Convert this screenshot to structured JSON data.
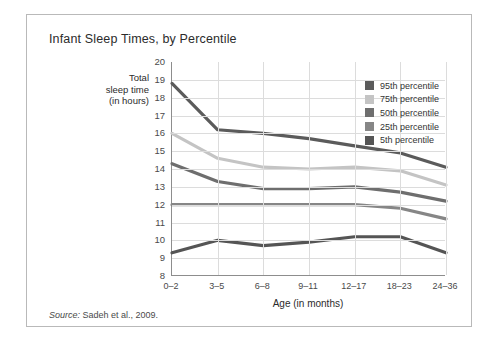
{
  "figure": {
    "title": "Infant Sleep Times, by Percentile",
    "source_prefix": "Source:",
    "source_text": " Sadeh et al., 2009."
  },
  "axes": {
    "y_title_line1": "Total",
    "y_title_line2": "sleep time",
    "y_title_line3": "(in hours)",
    "x_title": "Age (in months)",
    "y_ticks": [
      "20",
      "19",
      "18",
      "17",
      "16",
      "15",
      "14",
      "13",
      "12",
      "11",
      "10",
      "9",
      "8"
    ]
  },
  "legend": {
    "items": [
      {
        "label": "95th percentile",
        "color": "#5b5b5b"
      },
      {
        "label": "75th percentile",
        "color": "#c4c4c4"
      },
      {
        "label": "50th percentile",
        "color": "#6e6e6e"
      },
      {
        "label": "25th percentile",
        "color": "#868686"
      },
      {
        "label": "5th percentile",
        "color": "#555555"
      }
    ]
  },
  "chart_data": {
    "type": "line",
    "title": "Infant Sleep Times, by Percentile",
    "xlabel": "Age (in months)",
    "ylabel": "Total sleep time (in hours)",
    "categories": [
      "0-2",
      "3-5",
      "6-8",
      "9-11",
      "12-17",
      "18-23",
      "24-36"
    ],
    "ylim": [
      8,
      20
    ],
    "ytick_step": 1,
    "grid": true,
    "legend_position": "inside-top-right",
    "series": [
      {
        "name": "95th percentile",
        "color": "#5b5b5b",
        "values": [
          18.8,
          16.2,
          16.0,
          15.7,
          15.3,
          14.9,
          14.1
        ]
      },
      {
        "name": "75th percentile",
        "color": "#c4c4c4",
        "values": [
          16.0,
          14.6,
          14.1,
          14.0,
          14.1,
          13.9,
          13.1
        ]
      },
      {
        "name": "50th percentile",
        "color": "#6e6e6e",
        "values": [
          14.3,
          13.3,
          12.9,
          12.9,
          13.0,
          12.7,
          12.2
        ]
      },
      {
        "name": "25th percentile",
        "color": "#868686",
        "values": [
          12.0,
          12.0,
          12.0,
          12.0,
          12.0,
          11.8,
          11.2
        ]
      },
      {
        "name": "5th percentile",
        "color": "#555555",
        "values": [
          9.3,
          10.0,
          9.7,
          9.9,
          10.2,
          10.2,
          9.3
        ]
      }
    ]
  }
}
